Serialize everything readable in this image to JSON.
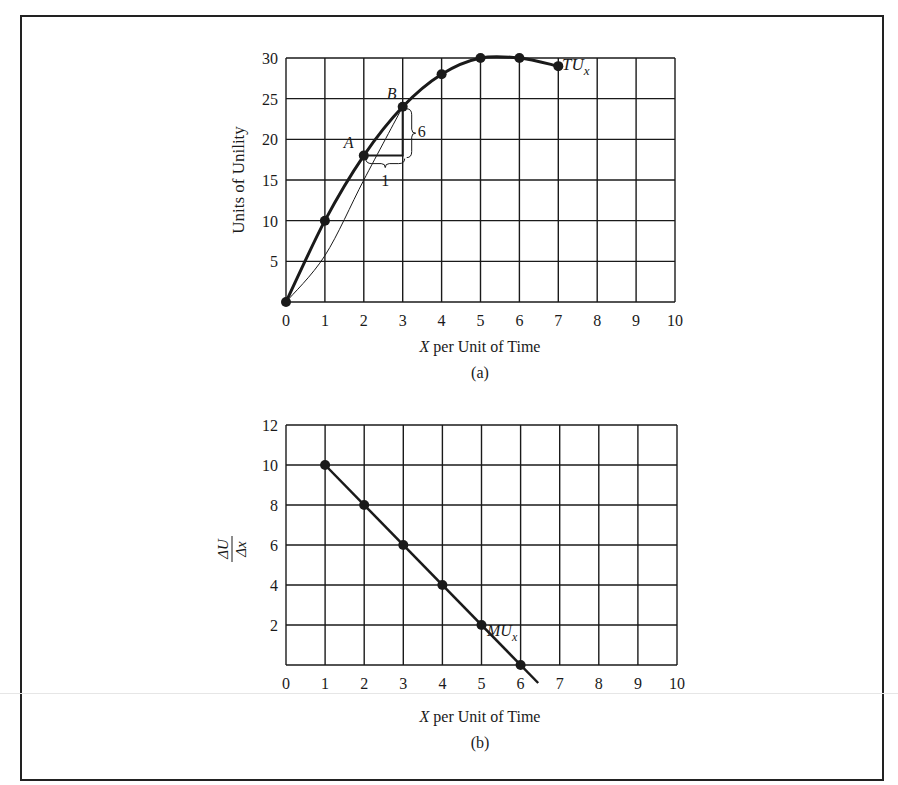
{
  "figure": {
    "panel_a": {
      "ylabel": "Units of Unility",
      "xlabel_var": "X",
      "xlabel_rest": " per Unit of Time",
      "caption": "(a)",
      "curve_label": "TU",
      "curve_label_sub": "x",
      "point_a_label": "A",
      "point_b_label": "B",
      "delta_y_label": "6",
      "delta_x_label": "1",
      "x_ticks": [
        "0",
        "1",
        "2",
        "3",
        "4",
        "5",
        "6",
        "7",
        "8",
        "9",
        "10"
      ],
      "y_ticks": [
        "5",
        "10",
        "15",
        "20",
        "25",
        "30"
      ]
    },
    "panel_b": {
      "ylabel_num": "ΔU",
      "ylabel_den": "Δx",
      "xlabel_var": "X",
      "xlabel_rest": " per Unit of Time",
      "caption": "(b)",
      "curve_label": "MU",
      "curve_label_sub": "x",
      "x_ticks": [
        "0",
        "1",
        "2",
        "3",
        "4",
        "5",
        "6",
        "7",
        "8",
        "9",
        "10"
      ],
      "y_ticks": [
        "2",
        "4",
        "6",
        "8",
        "10",
        "12"
      ]
    }
  },
  "chart_data": [
    {
      "type": "line",
      "title": "(a)",
      "xlabel": "X per Unit of Time",
      "ylabel": "Units of Unility",
      "xlim": [
        0,
        10
      ],
      "ylim": [
        0,
        30
      ],
      "grid": true,
      "x": [
        0,
        1,
        2,
        3,
        4,
        5,
        6,
        7
      ],
      "series": [
        {
          "name": "TUx",
          "values": [
            0,
            10,
            18,
            24,
            28,
            30,
            30,
            29
          ]
        }
      ],
      "annotations": [
        {
          "label": "A",
          "x": 2,
          "y": 18
        },
        {
          "label": "B",
          "x": 3,
          "y": 24
        },
        {
          "label": "6",
          "note": "vertical rise from A-level to B"
        },
        {
          "label": "1",
          "note": "horizontal run from x=2 to x=3"
        },
        {
          "note": "thin curve from origin to B: approx (0,0),(1,5.7),(2,15),(3,24)"
        }
      ],
      "x_ticks": [
        0,
        1,
        2,
        3,
        4,
        5,
        6,
        7,
        8,
        9,
        10
      ],
      "y_ticks": [
        5,
        10,
        15,
        20,
        25,
        30
      ]
    },
    {
      "type": "line",
      "title": "(b)",
      "xlabel": "X per Unit of Time",
      "ylabel": "ΔU/Δx",
      "xlim": [
        0,
        10
      ],
      "ylim": [
        0,
        12
      ],
      "grid": true,
      "x": [
        1,
        2,
        3,
        4,
        5,
        6
      ],
      "series": [
        {
          "name": "MUx",
          "values": [
            10,
            8,
            6,
            4,
            2,
            0
          ]
        }
      ],
      "x_ticks": [
        0,
        1,
        2,
        3,
        4,
        5,
        6,
        7,
        8,
        9,
        10
      ],
      "y_ticks": [
        2,
        4,
        6,
        8,
        10,
        12
      ]
    }
  ]
}
